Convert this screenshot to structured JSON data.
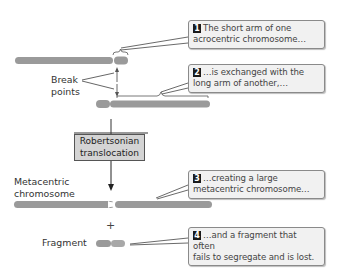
{
  "diagram": {
    "title": "Robertsonian translocation",
    "labels": {
      "break_points_line1": "Break",
      "break_points_line2": "points",
      "process_line1": "Robertsonian",
      "process_line2": "translocation",
      "metacentric_line1": "Metacentric",
      "metacentric_line2": "chromosome",
      "plus": "+",
      "fragment": "Fragment"
    },
    "callouts": [
      {
        "number": "1",
        "line1": "The short arm of one",
        "line2": "acrocentric chromosome…"
      },
      {
        "number": "2",
        "line1": "…is exchanged with the",
        "line2": "long arm of another,…"
      },
      {
        "number": "3",
        "line1": "…creating a large",
        "line2": "metacentric chromosome…"
      },
      {
        "number": "4",
        "line1": "…and a fragment that often",
        "line2": "fails to segregate and is lost."
      }
    ],
    "colors": {
      "chromosome": "#9a9a9a",
      "callout_bg": "#f1f1f1",
      "process_box_bg": "#d4d4d4",
      "number_badge": "#1a1a1a"
    }
  }
}
